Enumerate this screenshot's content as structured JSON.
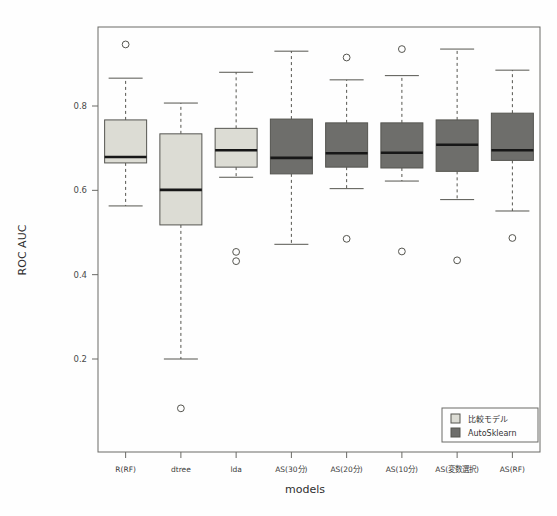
{
  "chart_data": {
    "type": "box",
    "title": "",
    "xlabel": "models",
    "ylabel": "ROC AUC",
    "categories": [
      "R(RF)",
      "dtree",
      "lda",
      "AS(30分)",
      "AS(20分)",
      "AS(10分)",
      "AS(変数選択)",
      "AS(RF)"
    ],
    "ylim": [
      0.06,
      0.96
    ],
    "yticks": [
      0.2,
      0.4,
      0.6,
      0.8
    ],
    "ytick_labels": [
      "0.2",
      "0.4",
      "0.6",
      "0.8"
    ],
    "grid": false,
    "legend_position": "bottom-right",
    "groups": [
      {
        "name": "比較モデル",
        "color": "#dcdcd4"
      },
      {
        "name": "AutoSklearn",
        "color": "#6e6e6b"
      }
    ],
    "boxes": [
      {
        "label": "R(RF)",
        "group": "比較モデル",
        "whisker_low": 0.563,
        "q1": 0.665,
        "median": 0.679,
        "q3": 0.767,
        "whisker_high": 0.866,
        "outliers": [
          0.946
        ]
      },
      {
        "label": "dtree",
        "group": "比較モデル",
        "whisker_low": 0.2,
        "q1": 0.518,
        "median": 0.601,
        "q3": 0.734,
        "whisker_high": 0.807,
        "outliers": [
          0.083
        ]
      },
      {
        "label": "lda",
        "group": "比較モデル",
        "whisker_low": 0.631,
        "q1": 0.655,
        "median": 0.695,
        "q3": 0.747,
        "whisker_high": 0.88,
        "outliers": [
          0.454,
          0.432
        ]
      },
      {
        "label": "AS(30分)",
        "group": "AutoSklearn",
        "whisker_low": 0.472,
        "q1": 0.639,
        "median": 0.677,
        "q3": 0.769,
        "whisker_high": 0.93,
        "outliers": []
      },
      {
        "label": "AS(20分)",
        "group": "AutoSklearn",
        "whisker_low": 0.604,
        "q1": 0.655,
        "median": 0.688,
        "q3": 0.76,
        "whisker_high": 0.862,
        "outliers": [
          0.915,
          0.485
        ]
      },
      {
        "label": "AS(10分)",
        "group": "AutoSklearn",
        "whisker_low": 0.622,
        "q1": 0.653,
        "median": 0.689,
        "q3": 0.76,
        "whisker_high": 0.872,
        "outliers": [
          0.935,
          0.455
        ]
      },
      {
        "label": "AS(変数選択)",
        "group": "AutoSklearn",
        "whisker_low": 0.578,
        "q1": 0.645,
        "median": 0.708,
        "q3": 0.767,
        "whisker_high": 0.935,
        "outliers": [
          0.434
        ]
      },
      {
        "label": "AS(RF)",
        "group": "AutoSklearn",
        "whisker_low": 0.551,
        "q1": 0.671,
        "median": 0.695,
        "q3": 0.783,
        "whisker_high": 0.885,
        "outliers": [
          0.487
        ]
      }
    ]
  },
  "axes": {
    "y_title": "ROC AUC",
    "x_title": "models"
  },
  "legend": {
    "items": [
      {
        "label": "比較モデル",
        "color": "#dcdcd4"
      },
      {
        "label": "AutoSklearn",
        "color": "#6e6e6b"
      }
    ]
  },
  "colors": {
    "light_box": "#dcdcd4",
    "dark_box": "#6e6e6b",
    "outline": "#555550",
    "median": "#171717",
    "frame": "#6a6a66",
    "background": "#fefefe"
  }
}
